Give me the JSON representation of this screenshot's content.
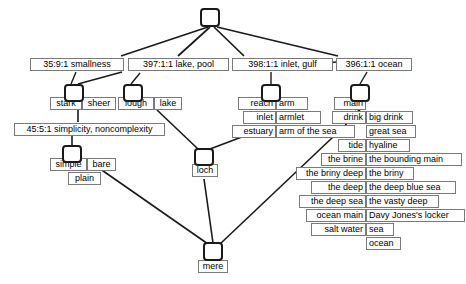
{
  "diagram": {
    "stroke_color": "#1a1a1a",
    "box_border_color": "#7a7a7a",
    "background": "#ffffff",
    "root": {
      "name": "root-node",
      "label": ""
    },
    "senses": [
      {
        "id": "smallness",
        "label": "35:9:1 smallness"
      },
      {
        "id": "lake-pool",
        "label": "397:1:1 lake, pool"
      },
      {
        "id": "inlet-gulf",
        "label": "398:1:1 inlet, gulf"
      },
      {
        "id": "ocean",
        "label": "396:1:1 ocean"
      },
      {
        "id": "simplicity",
        "label": "45:5:1 simplicity, noncomplexity"
      }
    ],
    "words": {
      "smallness_group": [
        "stark",
        "sheer"
      ],
      "lake_group": [
        "lough",
        "lake"
      ],
      "simplicity_group": [
        "simple",
        "bare",
        "plain"
      ],
      "loch_group": [
        "loch"
      ],
      "mere_group": [
        "mere"
      ],
      "inlet_group_left": [
        "reach",
        "inlet",
        "estuary"
      ],
      "inlet_group_right": [
        "arm",
        "armlet",
        "arm of the sea"
      ],
      "ocean_group_left": [
        "main",
        "drink",
        "tide",
        "the brine",
        "the briny deep",
        "the deep",
        "the deep sea",
        "ocean main",
        "salt water"
      ],
      "ocean_group_right": [
        "big drink",
        "great sea",
        "hyaline",
        "the bounding main",
        "the briny",
        "the deep blue sea",
        "the vasty deep",
        "Davy Jones's locker",
        "sea",
        "ocean"
      ]
    }
  }
}
